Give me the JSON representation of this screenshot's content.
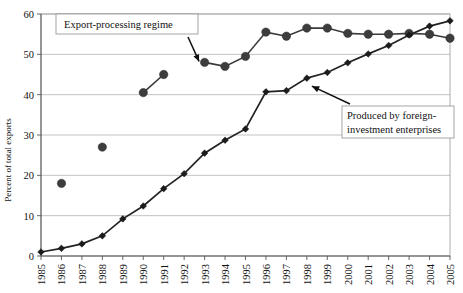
{
  "chart_data": {
    "type": "line",
    "title": "",
    "xlabel": "",
    "ylabel": "Percent of total exports",
    "ylim": [
      0,
      60
    ],
    "yticks": [
      0,
      10,
      20,
      30,
      40,
      50,
      60
    ],
    "grid": true,
    "legend_position": "none",
    "categories": [
      "1985",
      "1986",
      "1987",
      "1988",
      "1989",
      "1990",
      "1991",
      "1992",
      "1993",
      "1994",
      "1995",
      "1996",
      "1997",
      "1998",
      "1999",
      "2000",
      "2001",
      "2002",
      "2003",
      "2004",
      "2005"
    ],
    "series": [
      {
        "name": "Export-processing regime",
        "marker": "circle",
        "color": "#3d3d3d",
        "values": [
          null,
          18.0,
          null,
          27.0,
          null,
          40.5,
          45.0,
          null,
          48.0,
          47.0,
          49.5,
          55.5,
          54.5,
          56.5,
          56.5,
          55.2,
          55.0,
          55.0,
          55.2,
          55.0,
          54.0
        ],
        "segments": [
          [
            "1990",
            "1991"
          ],
          [
            "1993",
            "1994",
            "1995",
            "1996",
            "1997",
            "1998",
            "1999",
            "2000",
            "2001",
            "2002",
            "2003",
            "2004",
            "2005"
          ]
        ]
      },
      {
        "name": "Produced by foreign-investment enterprises",
        "marker": "diamond",
        "color": "#1c1c1c",
        "values": [
          1.0,
          1.9,
          3.0,
          5.0,
          9.2,
          12.4,
          16.7,
          20.4,
          25.5,
          28.7,
          31.5,
          40.7,
          41.0,
          44.1,
          45.5,
          47.9,
          50.1,
          52.2,
          54.8,
          57.0,
          58.3
        ]
      }
    ],
    "annotations": [
      {
        "id": "export-processing-regime",
        "text": "Export-processing regime",
        "points_to": "1996"
      },
      {
        "id": "foreign-investment-enterprises",
        "line1": "Produced by foreign-",
        "line2": "investment enterprises",
        "points_to": "1998"
      }
    ]
  },
  "axis": {
    "y_label": "Percent of total exports",
    "y_ticks": [
      "0",
      "10",
      "20",
      "30",
      "40",
      "50",
      "60"
    ],
    "x_ticks": [
      "1985",
      "1986",
      "1987",
      "1988",
      "1989",
      "1990",
      "1991",
      "1992",
      "1993",
      "1994",
      "1995",
      "1996",
      "1997",
      "1998",
      "1999",
      "2000",
      "2001",
      "2002",
      "2003",
      "2004",
      "2005"
    ]
  },
  "annotation_labels": {
    "box1": "Export-processing regime",
    "box2_line1": "Produced by foreign-",
    "box2_line2": "investment enterprises"
  },
  "colors": {
    "grid": "#b4b4b4",
    "axis": "#555555",
    "series_circle": "#3d3d3d",
    "series_diamond": "#1c1c1c",
    "background": "#ffffff"
  }
}
